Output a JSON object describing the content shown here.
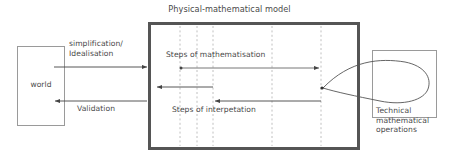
{
  "diagram": {
    "title": "Physical-mathematical model",
    "boxes": {
      "world": {
        "label": "world"
      },
      "model": {
        "label": "Physical-mathematical model"
      },
      "technical": {
        "label": "Technical\nmathematical\noperations"
      }
    },
    "edge_labels": {
      "simplification": "simplification/\nIdealisation",
      "validation": "Validation",
      "mathematisation": "Steps of mathematisation",
      "interpretation": "Steps of interpetation"
    },
    "colors": {
      "model_border": "#555555",
      "thin_border": "#9a9a9a",
      "arrow": "#444444",
      "dashed": "#b9b9b9",
      "text": "#4a4a4a",
      "background": "#ffffff"
    },
    "arrows": [
      {
        "name": "simplification-arrow",
        "from": "world",
        "to": "model",
        "direction": "right",
        "y": 67
      },
      {
        "name": "mathematisation-arrow",
        "from": "model-left",
        "to": "model-right",
        "direction": "right",
        "y": 67
      },
      {
        "name": "interpretation-inner-arrow",
        "from": "model-mid",
        "to": "model-left",
        "direction": "left",
        "y": 87
      },
      {
        "name": "interpretation-arrow",
        "from": "model-right",
        "to": "model-mid",
        "direction": "left",
        "y": 101
      },
      {
        "name": "validation-arrow",
        "from": "model",
        "to": "world",
        "direction": "left",
        "y": 101
      }
    ],
    "dashed_lines_x": [
      180,
      197,
      213,
      272,
      321
    ]
  }
}
